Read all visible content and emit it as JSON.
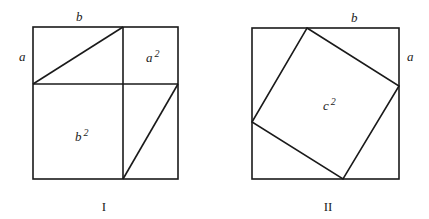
{
  "figures": [
    {
      "caption": "I",
      "labels": {
        "top_side": "b",
        "left_side": "a",
        "small_square": "a",
        "small_square_exp": "2",
        "large_square": "b",
        "large_square_exp": "2"
      }
    },
    {
      "caption": "II",
      "labels": {
        "top_side": "b",
        "right_side": "a",
        "inner_square": "c",
        "inner_square_exp": "2"
      }
    }
  ],
  "colors": {
    "stroke": "#1a1a1a",
    "background": "#ffffff"
  }
}
